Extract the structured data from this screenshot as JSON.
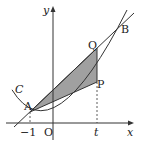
{
  "diagram": {
    "axes": {
      "x_label": "x",
      "y_label": "y",
      "origin_label": "O"
    },
    "curve_label": "C",
    "points": {
      "A": "A",
      "B": "B",
      "P": "P",
      "Q": "Q"
    },
    "ticks": {
      "neg_one": "−1",
      "t": "t"
    },
    "colors": {
      "stroke": "#333333",
      "shade": "#9a9a9a"
    }
  }
}
